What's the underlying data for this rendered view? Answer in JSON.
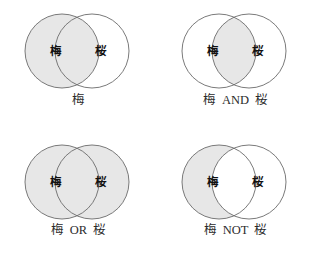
{
  "figure": {
    "title": "",
    "colors": {
      "background": "#ffffff",
      "circle_fill_shaded": "#e7e7e7",
      "circle_fill_empty": "#ffffff",
      "circle_stroke": "#6b6b6b",
      "label_text": "#111111",
      "caption_text": "#2b2b2b"
    },
    "geometry": {
      "circle_radius": 37,
      "left_circle_cx": 62,
      "right_circle_cx": 92,
      "circle_cy": 51
    }
  },
  "panels": [
    {
      "id": "panel-plum",
      "operation": "plum-only",
      "left_label": "梅",
      "right_label": "桜",
      "caption": "梅",
      "left_shaded": true,
      "right_shaded": false,
      "intersection_shaded": true
    },
    {
      "id": "panel-and",
      "operation": "and",
      "left_label": "梅",
      "right_label": "桜",
      "caption": "梅  AND  桜",
      "left_shaded": false,
      "right_shaded": false,
      "intersection_shaded": true
    },
    {
      "id": "panel-or",
      "operation": "or",
      "left_label": "梅",
      "right_label": "桜",
      "caption": "梅  OR  桜",
      "left_shaded": true,
      "right_shaded": true,
      "intersection_shaded": true
    },
    {
      "id": "panel-not",
      "operation": "not",
      "left_label": "梅",
      "right_label": "桜",
      "caption": "梅  NOT  桜",
      "left_shaded": true,
      "right_shaded": false,
      "intersection_shaded": false
    }
  ]
}
